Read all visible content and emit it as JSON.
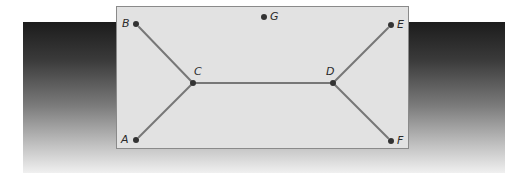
{
  "diagram": {
    "type": "graph",
    "colors": {
      "edge": "#777777",
      "node": "#333333",
      "panel": "#e2e2e2",
      "panel_border": "#8a8a8a"
    },
    "nodes": [
      {
        "id": "A",
        "label": "A",
        "x": 136,
        "y": 140
      },
      {
        "id": "B",
        "label": "B",
        "x": 136,
        "y": 24
      },
      {
        "id": "C",
        "label": "C",
        "x": 193,
        "y": 83
      },
      {
        "id": "D",
        "label": "D",
        "x": 333,
        "y": 83
      },
      {
        "id": "E",
        "label": "E",
        "x": 391,
        "y": 25
      },
      {
        "id": "F",
        "label": "F",
        "x": 391,
        "y": 141
      },
      {
        "id": "G",
        "label": "G",
        "x": 264,
        "y": 17
      }
    ],
    "edges": [
      {
        "from": "B",
        "to": "C"
      },
      {
        "from": "A",
        "to": "C"
      },
      {
        "from": "C",
        "to": "D"
      },
      {
        "from": "D",
        "to": "E"
      },
      {
        "from": "D",
        "to": "F"
      }
    ],
    "labels": {
      "A": "A",
      "B": "B",
      "C": "C",
      "D": "D",
      "E": "E",
      "F": "F",
      "G": "G"
    }
  }
}
